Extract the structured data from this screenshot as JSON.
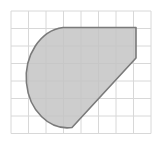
{
  "figure": {
    "title": "Shaded composite region on grid",
    "canvas": {
      "width": 165,
      "height": 148,
      "background": "#ffffff"
    },
    "grid": {
      "origin_x": 11,
      "origin_y": 11,
      "cell_size": 17.5,
      "columns": 8,
      "rows": 7,
      "width": 140,
      "height": 122.5,
      "line_color": "#d8d8d8",
      "line_width": 1,
      "visible": true
    },
    "shape": {
      "name": "shaded-region",
      "type": "composite-arc-polygon",
      "fill_color": "#c4c4c4",
      "fill_opacity": 0.85,
      "stroke_color": "#7a7a7a",
      "stroke_width": 1.6,
      "description": "Large rounded lobe on the left formed by a circular arc, a flat horizontal top edge, a short vertical right edge, and a straight diagonal edge returning to the bottom vertex.",
      "vertices": [
        {
          "label": "top-left-arc-start",
          "x": 63,
          "y": 27.5
        },
        {
          "label": "top-right-corner",
          "x": 136,
          "y": 27.5
        },
        {
          "label": "right-lower-corner",
          "x": 136,
          "y": 58
        },
        {
          "label": "bottom-vertex",
          "x": 72,
          "y": 127.5
        }
      ],
      "arc": {
        "from": {
          "x": 72,
          "y": 127.5
        },
        "to": {
          "x": 63,
          "y": 27.5
        },
        "radius_x": 41,
        "radius_y": 50,
        "sweep": "counterclockwise",
        "leftmost_x": 23,
        "center_y": 77.5
      },
      "path": "M 63 27.5 L 136 27.5 L 136 58 L 72 127.5 A 41 50 0 1 1 63 27.5 Z"
    }
  }
}
